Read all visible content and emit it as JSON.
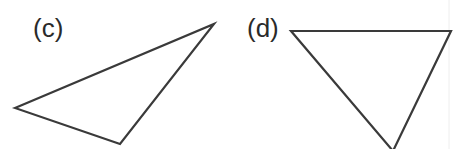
{
  "figures": [
    {
      "label": "(c)",
      "label_pos": [
        33,
        37
      ],
      "points": "15,108 214,24 120,144"
    },
    {
      "label": "(d)",
      "label_pos": [
        247,
        37
      ],
      "points": "291,31 451,31 393,151"
    }
  ]
}
